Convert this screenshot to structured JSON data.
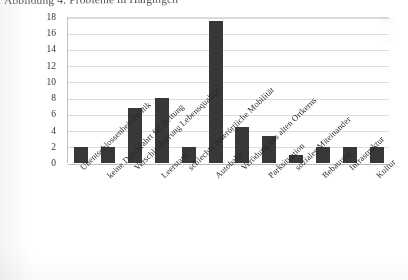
{
  "caption": "Abbildung 4: Probleme in Haigingen",
  "colors": {
    "bar": "#3b3b3b",
    "grid": "#d9d9d9",
    "axis": "#bdbdbd",
    "text": "#2b2b2b",
    "background": "#ffffff"
  },
  "chart_data": {
    "type": "bar",
    "title": "Abbildung 4: Probleme in Haigingen",
    "xlabel": "",
    "ylabel": "",
    "ylim": [
      0,
      18
    ],
    "ytick_step": 2,
    "yticks": [
      0,
      2,
      4,
      6,
      8,
      10,
      12,
      14,
      16,
      18
    ],
    "ytick_labels": [
      "0",
      "2",
      "4",
      "6",
      "8",
      "10",
      "12",
      "14",
      "16",
      "18"
    ],
    "grid": true,
    "grid_orientation": "horizontal",
    "legend": false,
    "legend_position": "none",
    "xtick_rotation": 45,
    "categories": [
      "Unentschlossenheit Politik",
      "keine Durchfahrt für Rettung",
      "Verschlechterung Lebensqualität",
      "Leerstand",
      "schlechte innerörtliche Mobilität",
      "Autobahn",
      "Verödung des alten Ortkerns",
      "Parksituation",
      "soziales Miteinander",
      "Bebauung",
      "Infrastruktur",
      "Kultur"
    ],
    "values": [
      2,
      2,
      6.8,
      8,
      2,
      17.5,
      4.5,
      3.3,
      1,
      2,
      2,
      2
    ],
    "series": [
      {
        "name": "Nennungen",
        "values": [
          2,
          2,
          6.8,
          8,
          2,
          17.5,
          4.5,
          3.3,
          1,
          2,
          2,
          2
        ]
      }
    ]
  }
}
